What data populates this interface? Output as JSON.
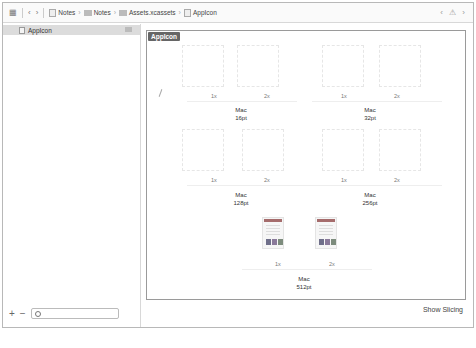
{
  "jumpbar": {
    "grid_icon": "grid-icon",
    "back_icon": "chevron-left-icon",
    "forward_icon": "chevron-right-icon",
    "breadcrumbs": [
      {
        "label": "Notes",
        "icon": "project-file-icon"
      },
      {
        "label": "Notes",
        "icon": "folder-icon"
      },
      {
        "label": "Assets.xcassets",
        "icon": "folder-icon"
      },
      {
        "label": "AppIcon",
        "icon": "appicon-file-icon"
      }
    ],
    "right_controls": "‹ ⚠ ›"
  },
  "sidebar": {
    "items": [
      {
        "label": "AppIcon",
        "selected": true
      }
    ],
    "add_label": "+",
    "remove_label": "−",
    "filter_placeholder": ""
  },
  "main": {
    "set_label": "AppIcon",
    "groups": [
      {
        "name": "Mac",
        "size": "16pt",
        "scales": [
          "1x",
          "2x"
        ]
      },
      {
        "name": "Mac",
        "size": "32pt",
        "scales": [
          "1x",
          "2x"
        ]
      },
      {
        "name": "Mac",
        "size": "128pt",
        "scales": [
          "1x",
          "2x"
        ]
      },
      {
        "name": "Mac",
        "size": "256pt",
        "scales": [
          "1x",
          "2x"
        ]
      },
      {
        "name": "Mac",
        "size": "512pt",
        "scales": [
          "1x",
          "2x"
        ]
      }
    ],
    "show_slicing_label": "Show Slicing"
  },
  "colors": {
    "set_label_bg": "#666666",
    "selection_bg": "#dcdcdc",
    "thumb_bar": "#a56c6c"
  }
}
